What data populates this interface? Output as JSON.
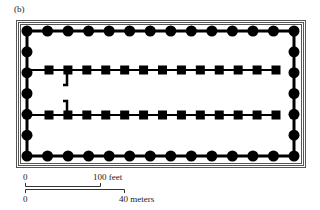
{
  "figure": {
    "panel_label": "(b)"
  },
  "plan": {
    "colors": {
      "ink": "#000000",
      "frame": "#555555",
      "background": "#ffffff"
    },
    "frame": {
      "x": 16,
      "y": 20,
      "width": 289,
      "height": 147,
      "lines": 3
    },
    "peristyle": {
      "front_columns": 14,
      "side_columns": 7,
      "top_y": 31,
      "bottom_y": 156,
      "left_x": 27,
      "right_x": 294
    },
    "inner_rows": {
      "count": 2,
      "columns_per_row": 13,
      "row_y": [
        70,
        115
      ],
      "first_x": 49,
      "last_x": 276
    }
  },
  "scale_bar": {
    "feet": {
      "start_label": "0",
      "end_label": "100 feet"
    },
    "meters": {
      "start_label": "0",
      "end_label": "40 meters"
    }
  }
}
